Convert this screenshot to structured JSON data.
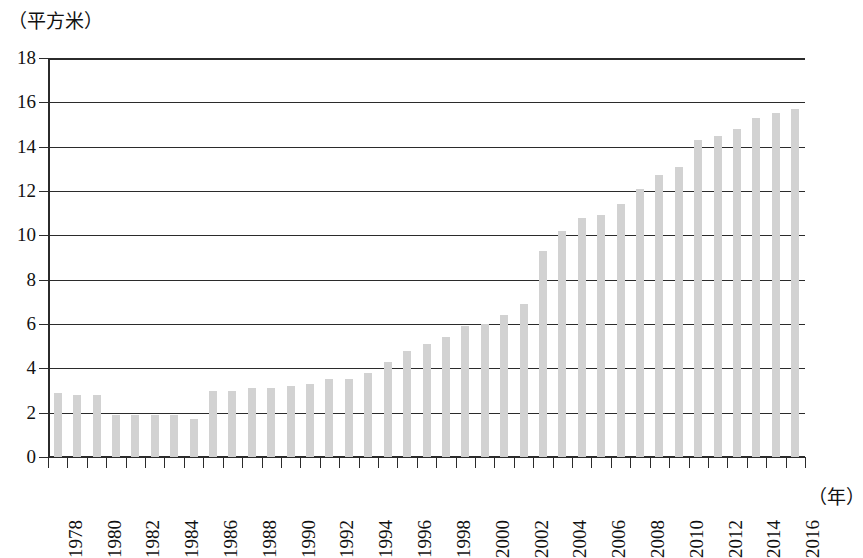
{
  "chart_data": {
    "type": "bar",
    "title": "",
    "subtitle": "",
    "xlabel": "（年）",
    "ylabel": "（平方米）",
    "y_unit_caption": "（平方米）",
    "x_unit_caption": "（年）",
    "ylim": [
      0,
      18
    ],
    "y_ticks": [
      0,
      2,
      4,
      6,
      8,
      10,
      12,
      14,
      16,
      18
    ],
    "y_tick_labels": [
      "0",
      "2",
      "4",
      "6",
      "8",
      "10",
      "12",
      "14",
      "16",
      "18"
    ],
    "grid": true,
    "grid_axis": "y",
    "legend": false,
    "legend_position": "none",
    "bar_color": "#d2d2d2",
    "axis_color": "#2b2b2b",
    "x_tick_label_rotation": 90,
    "x_tick_labels_shown": [
      "1978",
      "1980",
      "1982",
      "1984",
      "1986",
      "1988",
      "1990",
      "1992",
      "1994",
      "1996",
      "1998",
      "2000",
      "2002",
      "2004",
      "2006",
      "2008",
      "2010",
      "2012",
      "2014",
      "2016"
    ],
    "categories": [
      "1978",
      "1979",
      "1980",
      "1981",
      "1982",
      "1983",
      "1984",
      "1985",
      "1986",
      "1987",
      "1988",
      "1989",
      "1990",
      "1991",
      "1992",
      "1993",
      "1994",
      "1995",
      "1996",
      "1997",
      "1998",
      "1999",
      "2000",
      "2001",
      "2002",
      "2003",
      "2004",
      "2005",
      "2006",
      "2007",
      "2008",
      "2009",
      "2010",
      "2011",
      "2012",
      "2013",
      "2014",
      "2015",
      "2016"
    ],
    "values": [
      2.9,
      2.8,
      2.8,
      1.9,
      1.9,
      1.9,
      1.9,
      1.7,
      3.0,
      3.0,
      3.1,
      3.1,
      3.2,
      3.3,
      3.5,
      3.5,
      3.8,
      4.3,
      4.8,
      5.1,
      5.4,
      5.9,
      6.0,
      6.4,
      6.9,
      9.3,
      10.2,
      10.8,
      10.9,
      11.4,
      12.1,
      12.7,
      13.1,
      14.3,
      14.5,
      14.8,
      15.3,
      15.5,
      15.7
    ]
  }
}
